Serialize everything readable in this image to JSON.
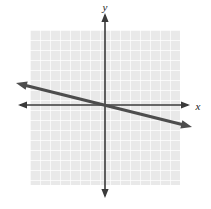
{
  "figure": {
    "width": 211,
    "height": 209,
    "background_color": "#ffffff"
  },
  "grid": {
    "fill_color": "#e9e9e9",
    "line_color": "#ffffff",
    "cell_size": 10,
    "left": 30,
    "top": 30,
    "right": 180,
    "bottom": 185,
    "columns": 15,
    "rows": 15,
    "visible": true
  },
  "axes": {
    "color": "#3a3a3a",
    "stroke_width": 1.6,
    "origin": {
      "x": 105,
      "y": 105
    },
    "x_axis": {
      "label": "x",
      "label_x": 198,
      "label_y": 110,
      "start_x": 18,
      "end_x": 190,
      "y": 105,
      "arrow_left": true,
      "arrow_right": true
    },
    "y_axis": {
      "label": "y",
      "label_x": 105,
      "label_y": 11,
      "start_y": 13,
      "end_y": 198,
      "x": 105,
      "arrow_up": true,
      "arrow_down": true
    },
    "tick_labels": []
  },
  "chart_data": {
    "type": "line",
    "title": "",
    "xlabel": "x",
    "ylabel": "y",
    "grid": true,
    "legend": "none",
    "xlim": [
      -7.5,
      7.5
    ],
    "ylim": [
      -7.5,
      7.5
    ],
    "series": [
      {
        "name": "line-1",
        "color": "#4d4d4d",
        "stroke_width": 3,
        "slope": -0.25,
        "intercept": 0,
        "equation": "y = -0.25x",
        "arrow_start": true,
        "arrow_end": true,
        "x": [
          -8.9,
          8.7
        ],
        "values": [
          2.2,
          -2.2
        ],
        "pixel_start": {
          "x": 16,
          "y": 83
        },
        "pixel_end": {
          "x": 192,
          "y": 127
        }
      }
    ]
  }
}
